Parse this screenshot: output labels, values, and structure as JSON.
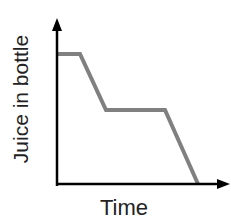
{
  "chart_data": {
    "type": "line",
    "title": "",
    "xlabel": "Time",
    "ylabel": "Juice in bottle",
    "x": [
      0,
      1,
      2,
      4.5,
      6
    ],
    "series": [
      {
        "name": "Juice in bottle",
        "values": [
          3,
          3,
          2,
          2,
          0
        ]
      }
    ],
    "xlim": [
      0,
      7
    ],
    "ylim": [
      0,
      4
    ],
    "grid": false,
    "legend": null,
    "colors": {
      "axis": "#000000",
      "line": "#808080"
    }
  }
}
